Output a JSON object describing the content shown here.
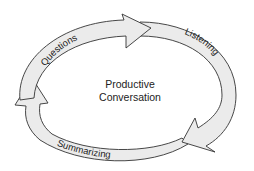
{
  "diagram": {
    "type": "cycle",
    "center": {
      "line1": "Productive",
      "line2": "Conversation"
    },
    "stages": [
      {
        "label": "Questions",
        "position": "top-left",
        "direction": "clockwise"
      },
      {
        "label": "Listening",
        "position": "right",
        "direction": "clockwise"
      },
      {
        "label": "Summarizing",
        "position": "bottom",
        "direction": "clockwise"
      }
    ],
    "colors": {
      "arrow_fill": "#ebebeb",
      "arrow_stroke": "#333333",
      "text": "#222222",
      "background": "#ffffff"
    }
  }
}
